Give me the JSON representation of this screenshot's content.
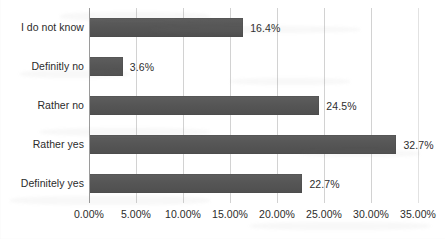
{
  "chart_data": {
    "type": "bar",
    "orientation": "horizontal",
    "title": "",
    "xlabel": "",
    "ylabel": "",
    "categories": [
      "I do not know",
      "Definitly no",
      "Rather no",
      "Rather yes",
      "Definitely yes"
    ],
    "values": [
      16.4,
      3.6,
      24.5,
      32.7,
      22.7
    ],
    "value_labels": [
      "16.4%",
      "3.6%",
      "24.5%",
      "32.7%",
      "22.7%"
    ],
    "xlim": [
      0,
      35
    ],
    "x_tick_values": [
      0,
      5,
      10,
      15,
      20,
      25,
      30,
      35
    ],
    "x_tick_labels": [
      "0.00%",
      "5.00%",
      "10.00%",
      "15.00%",
      "20.00%",
      "25.00%",
      "30.00%",
      "35.00%"
    ],
    "grid": true,
    "legend": false,
    "bar_color": "#565656",
    "gridline_color": "#d2d2d2",
    "text_color": "#2b2b2b"
  }
}
